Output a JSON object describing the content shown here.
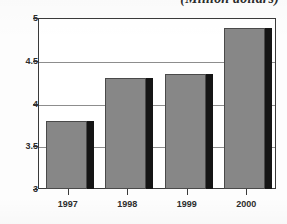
{
  "figure": {
    "title_partial": "(Million dollars)",
    "note": "title is cropped by the top edge of the screenshot"
  },
  "chart_data": {
    "type": "bar",
    "title": "(Million dollars)",
    "xlabel": "",
    "ylabel": "",
    "categories": [
      "1997",
      "1998",
      "1999",
      "2000"
    ],
    "values": [
      3.8,
      4.3,
      4.35,
      4.88
    ],
    "ylim": [
      3,
      5
    ],
    "yticks": [
      "3",
      "3.5",
      "4",
      "4.5",
      "5"
    ],
    "ytick_values": [
      3,
      3.5,
      4,
      4.5,
      5
    ],
    "grid": true,
    "legend": null,
    "series": [
      {
        "name": "value",
        "values": [
          3.8,
          4.3,
          4.35,
          4.88
        ]
      }
    ],
    "colors": {
      "bar_face": "#878787",
      "bar_shadow": "#151515",
      "axis": "#3a3a3a",
      "gridline": "#8d8d8d",
      "background": "#ffffff"
    }
  }
}
